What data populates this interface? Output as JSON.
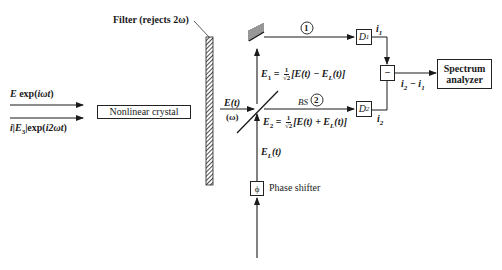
{
  "diagram": {
    "type": "optical-setup",
    "inputs": [
      {
        "id": "fundamental",
        "label": "E exp(iωt)"
      },
      {
        "id": "pump",
        "label": "i|E₃|exp(i2ωt)"
      }
    ],
    "components": {
      "crystal": {
        "label": "Nonlinear crystal"
      },
      "filter": {
        "label": "Filter (rejects 2ω)"
      },
      "beam_splitter": {
        "label": "BS"
      },
      "phase_shifter": {
        "label": "Phase shifter",
        "symbol": "ϕ"
      },
      "detector_1": {
        "label": "D",
        "sub": "1"
      },
      "detector_2": {
        "label": "D",
        "sub": "2"
      },
      "subtractor": {
        "symbol": "−"
      },
      "spectrum_analyzer": {
        "label_line1": "Spectrum",
        "label_line2": "analyzer"
      }
    },
    "signals": {
      "signal_field": {
        "main": "E(t)",
        "freq": "(ω)"
      },
      "local_oscillator": {
        "E": "E",
        "sub": "L",
        "arg": "(t)"
      },
      "e1": {
        "lhs": "E",
        "sub": "1",
        "eq": " = ",
        "num": "1",
        "den": "√2",
        "rhs": "[E(t) − E",
        "rhs_sub": "L",
        "rhs_end": "(t)]"
      },
      "e2": {
        "lhs": "E",
        "sub": "2",
        "eq": " = ",
        "num": "1",
        "den": "√2",
        "rhs": "[E(t) + E",
        "rhs_sub": "L",
        "rhs_end": "(t)]"
      },
      "i1": {
        "main": "i",
        "sub": "1"
      },
      "i2": {
        "main": "i",
        "sub": "2"
      },
      "difference": {
        "a": "i",
        "a_sub": "2",
        "op": " − ",
        "b": "i",
        "b_sub": "1"
      }
    },
    "paths": [
      {
        "id": "path-1",
        "label": "1"
      },
      {
        "id": "path-2",
        "label": "2"
      }
    ],
    "input_labels": {
      "fundamental_E": "E",
      "fundamental_rest": " exp(",
      "fundamental_arg": "iωt",
      "fundamental_close": ")",
      "pump_pre": "i|E",
      "pump_sub": "3",
      "pump_mid": "|exp(",
      "pump_arg": "i2ωt",
      "pump_close": ")"
    }
  }
}
